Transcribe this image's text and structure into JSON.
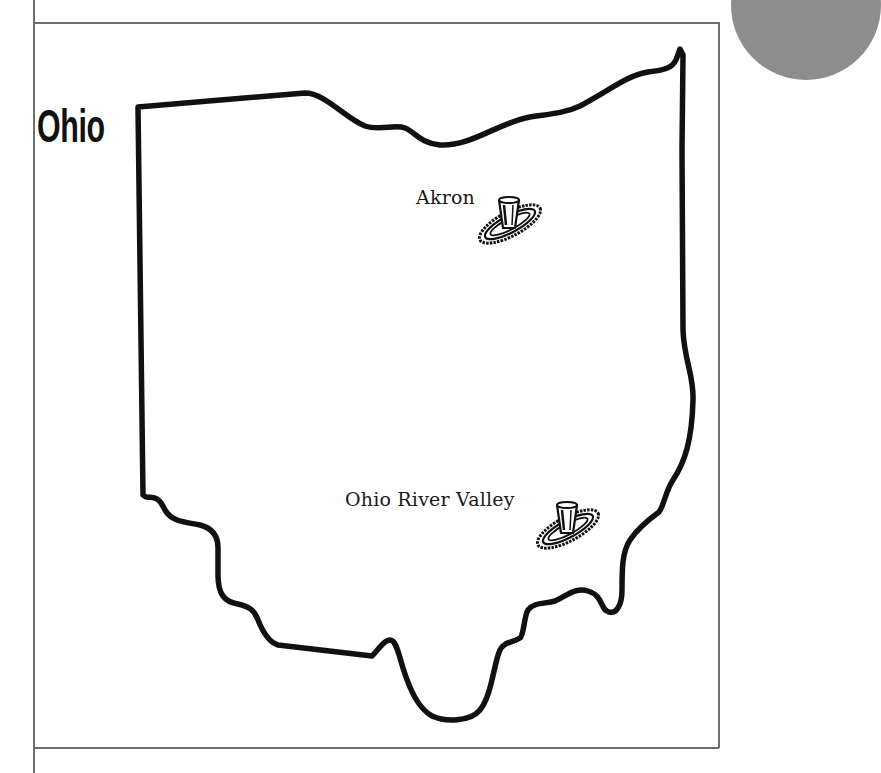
{
  "map": {
    "title": "Ohio",
    "outline_color": "#111111",
    "frame_color": "#6e6e6e",
    "corner_circle_color": "#8d8d8d"
  },
  "locations": [
    {
      "name": "Akron",
      "icon": "tire-and-glass-icon"
    },
    {
      "name": "Ohio River Valley",
      "icon": "tire-and-glass-icon"
    }
  ]
}
